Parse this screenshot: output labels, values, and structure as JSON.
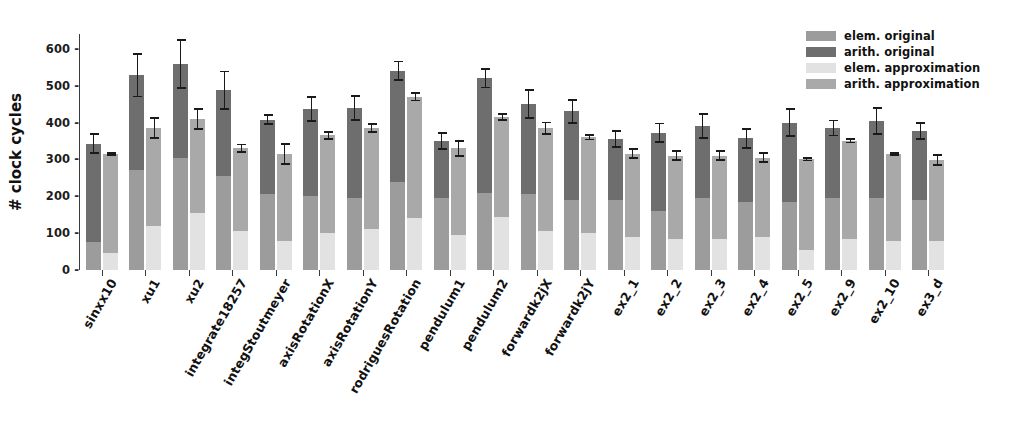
{
  "chart_data": {
    "type": "bar",
    "subtype": "grouped-stacked",
    "title": "",
    "xlabel": "",
    "ylabel": "# clock cycles",
    "ylim": [
      0,
      640
    ],
    "yticks": [
      0,
      100,
      200,
      300,
      400,
      500,
      600
    ],
    "grid": false,
    "legend_position": "top-right",
    "categories": [
      "sinxx10",
      "xu1",
      "xu2",
      "integrate18257",
      "integStoutmeyer",
      "axisRotationX",
      "axisRotationY",
      "rodriguesRotation",
      "pendulum1",
      "pendulum2",
      "forwardk2jX",
      "forwardk2jY",
      "ex2_1",
      "ex2_2",
      "ex2_3",
      "ex2_4",
      "ex2_5",
      "ex2_9",
      "ex2_10",
      "ex3_d"
    ],
    "series": [
      {
        "name": "elem. original",
        "color": "#9c9c9c",
        "bar": "original",
        "stack_order": 0,
        "values": [
          75,
          270,
          305,
          255,
          205,
          200,
          195,
          240,
          195,
          210,
          205,
          190,
          190,
          160,
          195,
          185,
          185,
          195,
          195,
          190
        ]
      },
      {
        "name": "arith. original",
        "color": "#6e6e6e",
        "bar": "original",
        "stack_order": 1,
        "values": [
          268,
          258,
          253,
          233,
          203,
          237,
          245,
          300,
          155,
          310,
          245,
          240,
          165,
          212,
          195,
          172,
          215,
          190,
          210,
          187
        ]
      },
      {
        "name": "elem. approximation",
        "color": "#e2e2e2",
        "bar": "approximation",
        "stack_order": 0,
        "values": [
          45,
          120,
          155,
          105,
          80,
          100,
          110,
          140,
          95,
          145,
          105,
          100,
          90,
          85,
          85,
          90,
          55,
          85,
          80,
          80
        ]
      },
      {
        "name": "arith. approximation",
        "color": "#a9a9a9",
        "bar": "approximation",
        "stack_order": 1,
        "values": [
          270,
          265,
          255,
          225,
          235,
          265,
          275,
          330,
          235,
          270,
          280,
          260,
          225,
          225,
          225,
          215,
          245,
          265,
          235,
          218
        ]
      }
    ],
    "totals": {
      "original": [
        343,
        528,
        558,
        488,
        408,
        437,
        440,
        540,
        350,
        520,
        450,
        430,
        355,
        372,
        390,
        357,
        400,
        385,
        405,
        377
      ],
      "approximation": [
        315,
        385,
        410,
        330,
        315,
        365,
        385,
        470,
        330,
        415,
        385,
        360,
        315,
        310,
        310,
        305,
        300,
        350,
        315,
        298
      ]
    },
    "errors": {
      "original": [
        25,
        57,
        65,
        50,
        12,
        32,
        32,
        25,
        22,
        25,
        37,
        30,
        22,
        25,
        32,
        25,
        37,
        20,
        35,
        22
      ],
      "approximation": [
        3,
        27,
        27,
        10,
        27,
        10,
        10,
        10,
        20,
        8,
        15,
        6,
        12,
        12,
        12,
        12,
        3,
        4,
        3,
        13
      ]
    }
  },
  "legend": {
    "items": [
      {
        "label": "elem. original",
        "color": "#9c9c9c"
      },
      {
        "label": "arith. original",
        "color": "#6e6e6e"
      },
      {
        "label": "elem. approximation",
        "color": "#e2e2e2"
      },
      {
        "label": "arith. approximation",
        "color": "#a9a9a9"
      }
    ]
  },
  "axis": {
    "y_title": "# clock cycles",
    "y_tick_labels": [
      "0",
      "100",
      "200",
      "300",
      "400",
      "500",
      "600"
    ],
    "tick_dash": "-"
  }
}
